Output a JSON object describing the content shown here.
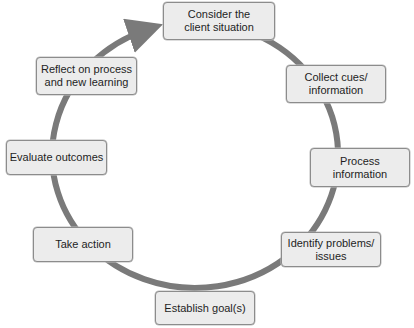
{
  "diagram": {
    "type": "cycle",
    "ring_color": "#7a7a7a",
    "box_fill": "#ececec",
    "box_border": "#8c8c8c",
    "steps": [
      {
        "label": "Consider the\nclient situation"
      },
      {
        "label": "Collect cues/\ninformation"
      },
      {
        "label": "Process\ninformation"
      },
      {
        "label": "Identify problems/\nissues"
      },
      {
        "label": "Establish goal(s)"
      },
      {
        "label": "Take action"
      },
      {
        "label": "Evaluate outcomes"
      },
      {
        "label": "Reflect on process\nand new learning"
      }
    ]
  }
}
